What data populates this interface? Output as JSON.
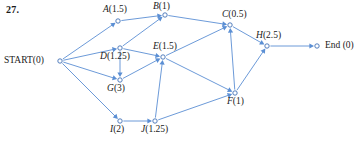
{
  "figure": {
    "problem_number": "27.",
    "edge_color": "#5b8fd4",
    "node_stroke_color": "#3f6fb5",
    "node_fill_color": "#ffffff",
    "text_color": "#1a1a1a",
    "width": 357,
    "height": 142
  },
  "chart_data": {
    "type": "diagram",
    "diagram_kind": "directed-activity-network",
    "title": "27.",
    "nodes": [
      {
        "id": "START",
        "label": "START(0)",
        "name": "START",
        "value": 0,
        "value_text": "(0)",
        "x": 60,
        "y": 61,
        "label_x": 4,
        "label_y": 56,
        "italic_name": false
      },
      {
        "id": "A",
        "label": "A(1.5)",
        "name": "A",
        "value": 1.5,
        "value_text": "(1.5)",
        "x": 118,
        "y": 21,
        "label_x": 103,
        "label_y": 5,
        "italic_name": true
      },
      {
        "id": "B",
        "label": "B(1)",
        "name": "B",
        "value": 1,
        "value_text": "(1)",
        "x": 165,
        "y": 15,
        "label_x": 153,
        "label_y": 2,
        "italic_name": true
      },
      {
        "id": "C",
        "label": "C(0.5)",
        "name": "C",
        "value": 0.5,
        "value_text": "(0.5)",
        "x": 230,
        "y": 25,
        "label_x": 222,
        "label_y": 10,
        "italic_name": true
      },
      {
        "id": "D",
        "label": "D(1.25)",
        "name": "D",
        "value": 1.25,
        "value_text": "(1.25)",
        "x": 120,
        "y": 48,
        "label_x": 100,
        "label_y": 52,
        "italic_name": true
      },
      {
        "id": "E",
        "label": "E(1.5)",
        "name": "E",
        "value": 1.5,
        "value_text": "(1.5)",
        "x": 163,
        "y": 57,
        "label_x": 153,
        "label_y": 42,
        "italic_name": true
      },
      {
        "id": "G",
        "label": "G(3)",
        "name": "G",
        "value": 3,
        "value_text": "(3)",
        "x": 120,
        "y": 80,
        "label_x": 107,
        "label_y": 84,
        "italic_name": true
      },
      {
        "id": "F",
        "label": "F(1)",
        "name": "F",
        "value": 1,
        "value_text": "(1)",
        "x": 235,
        "y": 93,
        "label_x": 227,
        "label_y": 97,
        "italic_name": true
      },
      {
        "id": "H",
        "label": "H(2.5)",
        "name": "H",
        "value": 2.5,
        "value_text": "(2.5)",
        "x": 267,
        "y": 46,
        "label_x": 256,
        "label_y": 31,
        "italic_name": true
      },
      {
        "id": "I",
        "label": "I(2)",
        "name": "I",
        "value": 2,
        "value_text": "(2)",
        "x": 120,
        "y": 121,
        "label_x": 110,
        "label_y": 125,
        "italic_name": true
      },
      {
        "id": "J",
        "label": "J(1.25)",
        "name": "J",
        "value": 1.25,
        "value_text": "(1.25)",
        "x": 155,
        "y": 121,
        "label_x": 141,
        "label_y": 125,
        "italic_name": true
      },
      {
        "id": "End",
        "label": "End (0)",
        "name": "End",
        "value": 0,
        "value_text": "(0)",
        "x": 317,
        "y": 46,
        "label_x": 325,
        "label_y": 41,
        "italic_name": false
      }
    ],
    "edges": [
      {
        "from": "START",
        "to": "A"
      },
      {
        "from": "START",
        "to": "D"
      },
      {
        "from": "START",
        "to": "G"
      },
      {
        "from": "START",
        "to": "I"
      },
      {
        "from": "A",
        "to": "B"
      },
      {
        "from": "D",
        "to": "B"
      },
      {
        "from": "D",
        "to": "E"
      },
      {
        "from": "D",
        "to": "G"
      },
      {
        "from": "B",
        "to": "C"
      },
      {
        "from": "E",
        "to": "C"
      },
      {
        "from": "G",
        "to": "E"
      },
      {
        "from": "E",
        "to": "F"
      },
      {
        "from": "I",
        "to": "J"
      },
      {
        "from": "J",
        "to": "E"
      },
      {
        "from": "J",
        "to": "F"
      },
      {
        "from": "F",
        "to": "C"
      },
      {
        "from": "C",
        "to": "H"
      },
      {
        "from": "F",
        "to": "H"
      },
      {
        "from": "H",
        "to": "End"
      }
    ]
  }
}
